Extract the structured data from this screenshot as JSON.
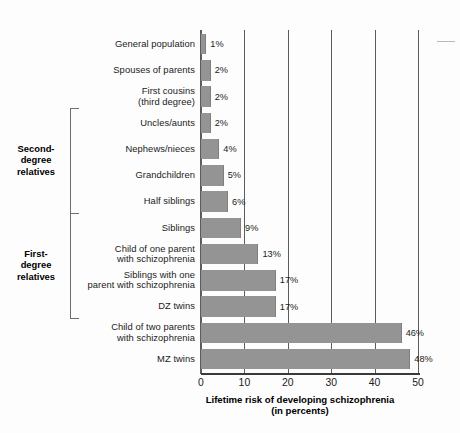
{
  "chart_data": {
    "type": "bar",
    "orientation": "horizontal",
    "title": "",
    "xlabel": "Lifetime risk of developing schizophrenia (in percents)",
    "xlabel_line1": "Lifetime risk of developing schizophrenia",
    "xlabel_line2": "(in percents)",
    "ylabel": "",
    "xlim": [
      0,
      50
    ],
    "xticks": [
      0,
      10,
      20,
      30,
      40,
      50
    ],
    "xtick_labels": [
      "0",
      "10",
      "20",
      "30",
      "40",
      "50"
    ],
    "grid": "vertical",
    "legend": "none",
    "bar_color": "#949494",
    "categories": [
      "General population",
      "Spouses of parents",
      "First cousins (third degree)",
      "Uncles/aunts",
      "Nephews/nieces",
      "Grandchildren",
      "Half siblings",
      "Siblings",
      "Child of one parent with schizophrenia",
      "Siblings with one parent with schizophrenia",
      "DZ twins",
      "Child of two parents with schizophrenia",
      "MZ twins"
    ],
    "values": [
      1,
      2,
      2,
      2,
      4,
      5,
      6,
      9,
      13,
      17,
      17,
      46,
      48
    ],
    "value_labels": [
      "1%",
      "2%",
      "2%",
      "2%",
      "4%",
      "5%",
      "6%",
      "9%",
      "13%",
      "17%",
      "17%",
      "46%",
      "48%"
    ]
  },
  "rows": [
    {
      "label_lines": [
        "General population"
      ],
      "value": 1,
      "value_label": "1%"
    },
    {
      "label_lines": [
        "Spouses of parents"
      ],
      "value": 2,
      "value_label": "2%"
    },
    {
      "label_lines": [
        "First cousins",
        "(third degree)"
      ],
      "value": 2,
      "value_label": "2%"
    },
    {
      "label_lines": [
        "Uncles/aunts"
      ],
      "value": 2,
      "value_label": "2%"
    },
    {
      "label_lines": [
        "Nephews/nieces"
      ],
      "value": 4,
      "value_label": "4%"
    },
    {
      "label_lines": [
        "Grandchildren"
      ],
      "value": 5,
      "value_label": "5%"
    },
    {
      "label_lines": [
        "Half siblings"
      ],
      "value": 6,
      "value_label": "6%"
    },
    {
      "label_lines": [
        "Siblings"
      ],
      "value": 9,
      "value_label": "9%"
    },
    {
      "label_lines": [
        "Child of one parent",
        "with schizophrenia"
      ],
      "value": 13,
      "value_label": "13%"
    },
    {
      "label_lines": [
        "Siblings with one",
        "parent with schizophrenia"
      ],
      "value": 17,
      "value_label": "17%"
    },
    {
      "label_lines": [
        "DZ twins"
      ],
      "value": 17,
      "value_label": "17%"
    },
    {
      "label_lines": [
        "Child of two parents",
        "with schizophrenia"
      ],
      "value": 46,
      "value_label": "46%"
    },
    {
      "label_lines": [
        "MZ twins"
      ],
      "value": 48,
      "value_label": "48%"
    }
  ],
  "groups": [
    {
      "name": "second-degree",
      "label_lines": [
        "Second-",
        "degree",
        "relatives"
      ],
      "first_row": 3,
      "last_row": 6
    },
    {
      "name": "first-degree",
      "label_lines": [
        "First-",
        "degree",
        "relatives"
      ],
      "first_row": 7,
      "last_row": 10
    }
  ],
  "axis": {
    "ticks": [
      "0",
      "10",
      "20",
      "30",
      "40",
      "50"
    ],
    "title_line1": "Lifetime risk of developing schizophrenia",
    "title_line2": "(in percents)"
  }
}
